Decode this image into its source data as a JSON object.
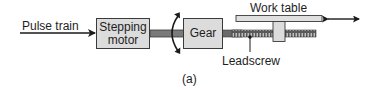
{
  "diagram": {
    "input_label": "Pulse train",
    "motor_label_line1": "Stepping",
    "motor_label_line2": "motor",
    "gear_label": "Gear",
    "table_label": "Work table",
    "leadscrew_label": "Leadscrew",
    "caption": "(a)",
    "colors": {
      "box_fill": "#dcdcdc",
      "outline": "#3a3a3a",
      "shaft": "#7a7a7a",
      "text": "#1e1e1e"
    }
  }
}
